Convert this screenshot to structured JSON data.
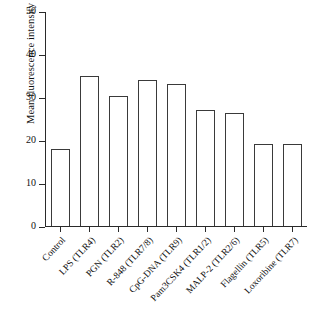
{
  "chart_data": {
    "type": "bar",
    "title": "",
    "subtitle": "",
    "xlabel": "",
    "ylabel": "Mean fluorescence intensity",
    "ylim": [
      0,
      50
    ],
    "yticks": [
      0,
      10,
      20,
      30,
      40,
      50
    ],
    "grid": false,
    "legend": null,
    "bar_style": {
      "fill": "#ffffff",
      "edge": "#3a3a3a"
    },
    "categories": [
      "Control",
      "LPS (TLR4)",
      "PGN (TLR2)",
      "R-848 (TLR7/8)",
      "CpG-DNA (TLR9)",
      "Pam3CSK4 (TLR1/2)",
      "MALP-2 (TLR2/6)",
      "Flagellin (TLR5)",
      "Loxoribine (TLR7)"
    ],
    "values": [
      17.9,
      35.1,
      30.3,
      34.2,
      33.1,
      27.0,
      26.5,
      19.1,
      19.1
    ]
  }
}
